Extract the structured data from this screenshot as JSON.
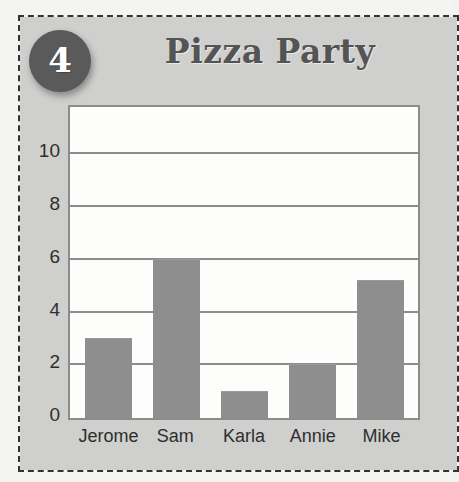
{
  "card": {
    "badge_number": "4",
    "background_color": "#cfcfcd",
    "cut_line_color": "#333333"
  },
  "chart_data": {
    "type": "bar",
    "title": "Pizza Party",
    "xlabel": "",
    "ylabel": "",
    "categories": [
      "Jerome",
      "Sam",
      "Karla",
      "Annie",
      "Mike"
    ],
    "values": [
      3,
      6,
      1,
      2,
      5.2
    ],
    "ylim": [
      0,
      11.8
    ],
    "yticks": [
      0,
      2,
      4,
      6,
      8,
      10
    ],
    "ytick_labels": [
      "0",
      "2",
      "4",
      "6",
      "8",
      "10"
    ],
    "grid": true,
    "legend": "none",
    "bar_color": "#8e8e8e",
    "plot_background": "#fdfdfc",
    "axis_color": "#8c8c8c",
    "title_color": "#545454"
  }
}
